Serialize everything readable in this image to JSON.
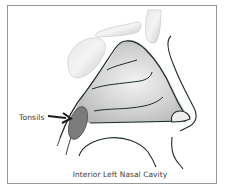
{
  "diagram": {
    "labels": {
      "tonsils": "Tonsils"
    },
    "caption": "Interior Left Nasal Cavity",
    "colors": {
      "frame": "#9a9a9a",
      "outline": "#1e2b2b",
      "tissue_fill": "#cfcfcf",
      "bone_fill": "#dcdcdc",
      "tonsil_fill": "#7a7a7a",
      "text": "#3a3a3a"
    }
  }
}
